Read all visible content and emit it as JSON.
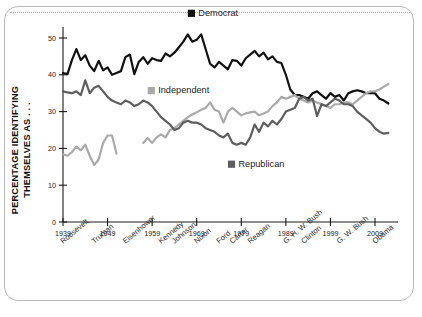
{
  "chart_data": {
    "type": "line",
    "title": "",
    "subtitle": "",
    "xlabel": "",
    "ylabel": "PERCENTAGE IDENTIFYING THEMSELVES AS . . .",
    "xlim": [
      1939,
      2013
    ],
    "ylim": [
      0,
      53
    ],
    "grid": false,
    "legend_position": "inside-plot",
    "yticks": [
      0,
      10,
      20,
      30,
      40,
      50
    ],
    "ytick_labels": [
      "0",
      "10",
      "20",
      "30",
      "40",
      "50"
    ],
    "xticks": [
      1939,
      1949,
      1959,
      1969,
      1979,
      1989,
      1999,
      2009
    ],
    "xtick_labels": [
      "1939",
      "1949",
      "1959",
      "1969",
      "1979",
      "1989",
      "1999",
      "2009"
    ],
    "president_labels": [
      {
        "name": "Roosevelt",
        "year": 1939
      },
      {
        "name": "Truman",
        "year": 1946
      },
      {
        "name": "Eisenhower",
        "year": 1953
      },
      {
        "name": "Kennedy",
        "year": 1961
      },
      {
        "name": "Johnson",
        "year": 1964
      },
      {
        "name": "Nixon",
        "year": 1969
      },
      {
        "name": "Ford",
        "year": 1974
      },
      {
        "name": "Carter",
        "year": 1977
      },
      {
        "name": "Reagan",
        "year": 1981
      },
      {
        "name": "G. H. W. Bush",
        "year": 1989
      },
      {
        "name": "Clinton",
        "year": 1993
      },
      {
        "name": "G. W. Bush",
        "year": 2001
      },
      {
        "name": "Obama",
        "year": 2009
      }
    ],
    "series": [
      {
        "name": "Democrat",
        "color": "#111111",
        "label_year": 1967,
        "label_value": 56,
        "x": [
          1939,
          1940,
          1941,
          1942,
          1943,
          1944,
          1945,
          1946,
          1947,
          1948,
          1949,
          1950,
          1951,
          1952,
          1953,
          1954,
          1955,
          1956,
          1957,
          1958,
          1959,
          1960,
          1961,
          1962,
          1963,
          1964,
          1965,
          1966,
          1967,
          1968,
          1969,
          1970,
          1971,
          1972,
          1973,
          1974,
          1975,
          1976,
          1977,
          1978,
          1979,
          1980,
          1981,
          1982,
          1983,
          1984,
          1985,
          1986,
          1987,
          1988,
          1989,
          1990,
          1991,
          1992,
          1993,
          1994,
          1995,
          1996,
          1997,
          1998,
          1999,
          2000,
          2001,
          2002,
          2003,
          2004,
          2005,
          2006,
          2007,
          2008,
          2009,
          2010,
          2011,
          2012
        ],
        "values": [
          40.5,
          40.2,
          44.0,
          47.0,
          44.0,
          45.3,
          42.5,
          41.0,
          43.8,
          41.2,
          42.0,
          40.0,
          40.5,
          41.0,
          44.8,
          45.5,
          40.2,
          43.5,
          44.8,
          43.0,
          44.5,
          44.0,
          43.8,
          45.8,
          45.0,
          46.0,
          47.5,
          49.0,
          51.0,
          49.0,
          49.5,
          51.0,
          47.0,
          43.0,
          42.0,
          43.5,
          42.5,
          41.5,
          44.0,
          43.8,
          42.5,
          44.5,
          45.5,
          46.5,
          45.0,
          46.0,
          44.2,
          45.0,
          43.5,
          43.2,
          40.0,
          36.0,
          34.5,
          34.5,
          34.0,
          33.5,
          35.0,
          35.5,
          34.5,
          33.5,
          35.0,
          34.0,
          34.5,
          33.0,
          35.0,
          35.5,
          35.8,
          35.5,
          35.0,
          35.0,
          35.0,
          33.5,
          33.0,
          32.2
        ]
      },
      {
        "name": "Independent",
        "color": "#aaaaaa",
        "label_year": 1958,
        "label_value": 35,
        "segments": [
          {
            "x": [
              1939,
              1940,
              1941,
              1942,
              1943,
              1944,
              1945,
              1946,
              1947,
              1948,
              1949,
              1950,
              1951
            ],
            "values": [
              18.4,
              18.0,
              19.0,
              20.5,
              19.5,
              21.0,
              18.0,
              15.5,
              17.0,
              21.5,
              23.5,
              23.5,
              18.6
            ]
          },
          {
            "x": [
              1957,
              1958,
              1959,
              1960,
              1961,
              1962,
              1963,
              1964,
              1965,
              1966,
              1967,
              1968,
              1969,
              1970,
              1971,
              1972,
              1973,
              1974,
              1975,
              1976,
              1977,
              1978,
              1979,
              1980,
              1981,
              1982,
              1983,
              1984,
              1985,
              1986,
              1987,
              1988,
              1989,
              1990,
              1991,
              1992,
              1993,
              1994,
              1995,
              1996,
              1997,
              1998,
              1999,
              2000,
              2001,
              2002,
              2003,
              2004,
              2005,
              2006,
              2007,
              2008,
              2009,
              2010,
              2011,
              2012
            ],
            "values": [
              21.5,
              22.8,
              21.5,
              23.0,
              23.8,
              23.0,
              25.0,
              25.5,
              26.5,
              27.5,
              28.5,
              29.2,
              29.8,
              30.5,
              31.0,
              32.5,
              30.5,
              30.0,
              27.0,
              30.0,
              31.0,
              30.0,
              29.0,
              29.5,
              29.8,
              30.0,
              29.0,
              29.5,
              30.0,
              31.5,
              32.5,
              34.0,
              33.5,
              34.0,
              34.5,
              33.5,
              33.0,
              32.5,
              33.0,
              32.5,
              32.0,
              31.5,
              31.0,
              32.0,
              32.0,
              32.5,
              32.5,
              32.0,
              33.0,
              34.0,
              35.0,
              35.5,
              35.5,
              36.0,
              36.8,
              37.5
            ]
          }
        ]
      },
      {
        "name": "Republican",
        "color": "#5e5e5e",
        "label_year": 1976,
        "label_value": 15,
        "x": [
          1939,
          1940,
          1941,
          1942,
          1943,
          1944,
          1945,
          1946,
          1947,
          1948,
          1949,
          1950,
          1951,
          1952,
          1953,
          1954,
          1955,
          1956,
          1957,
          1958,
          1959,
          1960,
          1961,
          1962,
          1963,
          1964,
          1965,
          1966,
          1967,
          1968,
          1969,
          1970,
          1971,
          1972,
          1973,
          1974,
          1975,
          1976,
          1977,
          1978,
          1979,
          1980,
          1981,
          1982,
          1983,
          1984,
          1985,
          1986,
          1987,
          1988,
          1989,
          1990,
          1991,
          1992,
          1993,
          1994,
          1995,
          1996,
          1997,
          1998,
          1999,
          2000,
          2001,
          2002,
          2003,
          2004,
          2005,
          2006,
          2007,
          2008,
          2009,
          2010,
          2011,
          2012
        ],
        "values": [
          35.5,
          35.2,
          35.0,
          35.5,
          34.5,
          38.5,
          35.0,
          36.5,
          37.0,
          35.5,
          34.0,
          33.0,
          32.5,
          32.0,
          33.0,
          32.5,
          31.5,
          32.0,
          33.0,
          32.5,
          31.5,
          30.0,
          28.5,
          27.5,
          26.5,
          25.0,
          25.5,
          27.0,
          27.5,
          27.0,
          27.0,
          26.5,
          25.5,
          25.0,
          24.5,
          23.5,
          23.0,
          24.0,
          21.5,
          21.0,
          21.5,
          21.0,
          23.0,
          26.5,
          24.5,
          27.0,
          26.0,
          27.5,
          26.5,
          28.0,
          30.0,
          30.5,
          31.0,
          33.5,
          34.0,
          33.0,
          33.5,
          28.8,
          32.0,
          31.5,
          32.5,
          33.5,
          33.0,
          32.0,
          32.0,
          31.5,
          30.0,
          29.0,
          28.0,
          27.0,
          25.5,
          24.5,
          24.0,
          24.2
        ]
      }
    ]
  },
  "legend": {
    "democrat": "Democrat",
    "independent": "Independent",
    "republican": "Republican"
  },
  "axis": {
    "ylabel_line1": "PERCENTAGE IDENTIFYING",
    "ylabel_line2": "THEMSELVES AS . . ."
  }
}
